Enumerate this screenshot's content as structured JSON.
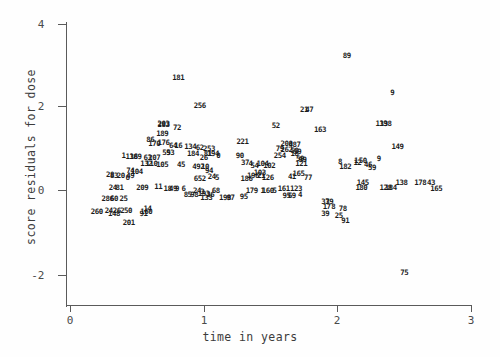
{
  "chart_data": {
    "type": "scatter",
    "title": "",
    "xlabel": "time in years",
    "ylabel": "score residuals for dose",
    "xlim": [
      -0.16,
      3.05
    ],
    "ylim": [
      -2.6,
      4.3
    ],
    "xticks": [
      0,
      1,
      2,
      3
    ],
    "xtick_labels": [
      "0",
      "1",
      "2",
      "3"
    ],
    "yticks": [
      4,
      2,
      0,
      -2
    ],
    "ytick_labels": [
      "4",
      "2",
      "0",
      "-2"
    ],
    "grid": false,
    "legend": null,
    "marker_style": "numeric-subject-id-label",
    "note": "Each plotted point is drawn as its subject id number rather than a symbol; heavy overplotting near y=0.",
    "points": [
      {
        "label": "181",
        "x": 0.81,
        "y": 2.7
      },
      {
        "label": "89",
        "x": 2.07,
        "y": 3.22
      },
      {
        "label": "9",
        "x": 2.41,
        "y": 2.34
      },
      {
        "label": "256",
        "x": 0.97,
        "y": 2.02
      },
      {
        "label": "21",
        "x": 1.75,
        "y": 1.93
      },
      {
        "label": "47",
        "x": 1.79,
        "y": 1.93
      },
      {
        "label": "139",
        "x": 2.33,
        "y": 1.6
      },
      {
        "label": "138",
        "x": 2.36,
        "y": 1.6
      },
      {
        "label": "283",
        "x": 0.7,
        "y": 1.56
      },
      {
        "label": "203",
        "x": 0.7,
        "y": 1.58
      },
      {
        "label": "72",
        "x": 0.8,
        "y": 1.5
      },
      {
        "label": "52",
        "x": 1.54,
        "y": 1.55
      },
      {
        "label": "163",
        "x": 1.87,
        "y": 1.45
      },
      {
        "label": "189",
        "x": 0.69,
        "y": 1.36
      },
      {
        "label": "86",
        "x": 0.6,
        "y": 1.2
      },
      {
        "label": "170",
        "x": 0.63,
        "y": 1.12
      },
      {
        "label": "176",
        "x": 0.7,
        "y": 1.13
      },
      {
        "label": "221",
        "x": 1.29,
        "y": 1.15
      },
      {
        "label": "200",
        "x": 1.62,
        "y": 1.12
      },
      {
        "label": "487",
        "x": 1.68,
        "y": 1.08
      },
      {
        "label": "149",
        "x": 2.45,
        "y": 1.03
      },
      {
        "label": "64",
        "x": 0.77,
        "y": 1.06
      },
      {
        "label": "16",
        "x": 0.81,
        "y": 1.05
      },
      {
        "label": "134",
        "x": 0.9,
        "y": 1.03
      },
      {
        "label": "62",
        "x": 0.97,
        "y": 1.02
      },
      {
        "label": "253",
        "x": 1.04,
        "y": 0.99
      },
      {
        "label": "79",
        "x": 1.57,
        "y": 1.0
      },
      {
        "label": "262",
        "x": 1.62,
        "y": 0.97
      },
      {
        "label": "58",
        "x": 1.68,
        "y": 0.93
      },
      {
        "label": "59",
        "x": 1.7,
        "y": 0.92
      },
      {
        "label": "55",
        "x": 0.72,
        "y": 0.9
      },
      {
        "label": "93",
        "x": 0.75,
        "y": 0.9
      },
      {
        "label": "184",
        "x": 0.92,
        "y": 0.86
      },
      {
        "label": "81",
        "x": 1.03,
        "y": 0.86
      },
      {
        "label": "194",
        "x": 1.07,
        "y": 0.86
      },
      {
        "label": "0",
        "x": 1.11,
        "y": 0.83
      },
      {
        "label": "90",
        "x": 1.27,
        "y": 0.83
      },
      {
        "label": "254",
        "x": 1.57,
        "y": 0.82
      },
      {
        "label": "18",
        "x": 1.68,
        "y": 0.86
      },
      {
        "label": "1",
        "x": 0.4,
        "y": 0.81
      },
      {
        "label": "136",
        "x": 0.46,
        "y": 0.8
      },
      {
        "label": "189",
        "x": 0.49,
        "y": 0.8
      },
      {
        "label": "63",
        "x": 0.58,
        "y": 0.77
      },
      {
        "label": "207",
        "x": 0.63,
        "y": 0.76
      },
      {
        "label": "59",
        "x": 1.72,
        "y": 0.74
      },
      {
        "label": "99",
        "x": 1.74,
        "y": 0.72
      },
      {
        "label": "9",
        "x": 2.31,
        "y": 0.74
      },
      {
        "label": "37",
        "x": 1.31,
        "y": 0.66
      },
      {
        "label": "4",
        "x": 1.35,
        "y": 0.63
      },
      {
        "label": "104",
        "x": 1.44,
        "y": 0.63
      },
      {
        "label": "54",
        "x": 1.38,
        "y": 0.57
      },
      {
        "label": "102",
        "x": 1.49,
        "y": 0.58
      },
      {
        "label": "132",
        "x": 0.57,
        "y": 0.62
      },
      {
        "label": "110",
        "x": 0.61,
        "y": 0.62
      },
      {
        "label": "105",
        "x": 0.69,
        "y": 0.6
      },
      {
        "label": "45",
        "x": 0.83,
        "y": 0.6
      },
      {
        "label": "26",
        "x": 1.0,
        "y": 0.78
      },
      {
        "label": "8",
        "x": 2.02,
        "y": 0.67
      },
      {
        "label": "1",
        "x": 2.14,
        "y": 0.7
      },
      {
        "label": "50",
        "x": 2.19,
        "y": 0.7
      },
      {
        "label": "12",
        "x": 2.15,
        "y": 0.64
      },
      {
        "label": "182",
        "x": 2.06,
        "y": 0.56
      },
      {
        "label": "59",
        "x": 2.26,
        "y": 0.53
      },
      {
        "label": "46",
        "x": 2.23,
        "y": 0.6
      },
      {
        "label": "121",
        "x": 1.73,
        "y": 0.62
      },
      {
        "label": "492",
        "x": 0.96,
        "y": 0.55
      },
      {
        "label": "10",
        "x": 1.01,
        "y": 0.55
      },
      {
        "label": "94",
        "x": 1.04,
        "y": 0.47
      },
      {
        "label": "74",
        "x": 0.45,
        "y": 0.45
      },
      {
        "label": "104",
        "x": 0.5,
        "y": 0.43
      },
      {
        "label": "49",
        "x": 0.45,
        "y": 0.33
      },
      {
        "label": "28",
        "x": 0.3,
        "y": 0.36
      },
      {
        "label": "83",
        "x": 0.33,
        "y": 0.34
      },
      {
        "label": "20",
        "x": 0.38,
        "y": 0.33
      },
      {
        "label": "6",
        "x": 0.43,
        "y": 0.3
      },
      {
        "label": "652",
        "x": 0.97,
        "y": 0.27
      },
      {
        "label": "24",
        "x": 1.06,
        "y": 0.31
      },
      {
        "label": "5",
        "x": 1.1,
        "y": 0.28
      },
      {
        "label": "21",
        "x": 1.43,
        "y": 0.33
      },
      {
        "label": "126",
        "x": 1.48,
        "y": 0.3
      },
      {
        "label": "41",
        "x": 1.66,
        "y": 0.31
      },
      {
        "label": "77",
        "x": 1.78,
        "y": 0.3
      },
      {
        "label": "165",
        "x": 1.71,
        "y": 0.38
      },
      {
        "label": "103",
        "x": 1.42,
        "y": 0.42
      },
      {
        "label": "196",
        "x": 1.37,
        "y": 0.34
      },
      {
        "label": "186",
        "x": 1.32,
        "y": 0.26
      },
      {
        "label": "145",
        "x": 2.19,
        "y": 0.17
      },
      {
        "label": "138",
        "x": 2.48,
        "y": 0.17
      },
      {
        "label": "178",
        "x": 2.62,
        "y": 0.17
      },
      {
        "label": "43",
        "x": 2.7,
        "y": 0.17
      },
      {
        "label": "180",
        "x": 2.18,
        "y": 0.05
      },
      {
        "label": "128",
        "x": 2.36,
        "y": 0.05
      },
      {
        "label": "184",
        "x": 2.4,
        "y": 0.05
      },
      {
        "label": "165",
        "x": 2.74,
        "y": 0.03
      },
      {
        "label": "24",
        "x": 0.32,
        "y": 0.06
      },
      {
        "label": "81",
        "x": 0.37,
        "y": 0.06
      },
      {
        "label": "209",
        "x": 0.54,
        "y": 0.05
      },
      {
        "label": "11",
        "x": 0.66,
        "y": 0.07
      },
      {
        "label": "18",
        "x": 0.73,
        "y": 0.03
      },
      {
        "label": "49",
        "x": 0.77,
        "y": 0.03
      },
      {
        "label": "9",
        "x": 0.8,
        "y": 0.02
      },
      {
        "label": "6",
        "x": 0.85,
        "y": 0.02
      },
      {
        "label": "24",
        "x": 0.95,
        "y": -0.03
      },
      {
        "label": "3",
        "x": 0.99,
        "y": -0.04
      },
      {
        "label": "68",
        "x": 1.09,
        "y": -0.03
      },
      {
        "label": "161",
        "x": 1.6,
        "y": 0.02
      },
      {
        "label": "123",
        "x": 1.69,
        "y": 0.02
      },
      {
        "label": "179",
        "x": 1.36,
        "y": -0.02
      },
      {
        "label": "1",
        "x": 1.44,
        "y": -0.02
      },
      {
        "label": "160",
        "x": 1.48,
        "y": -0.02
      },
      {
        "label": "5",
        "x": 1.53,
        "y": -0.02
      },
      {
        "label": "85",
        "x": 0.88,
        "y": -0.12
      },
      {
        "label": "98",
        "x": 0.93,
        "y": -0.11
      },
      {
        "label": "193",
        "x": 1.0,
        "y": -0.1
      },
      {
        "label": "36",
        "x": 1.05,
        "y": -0.11
      },
      {
        "label": "133",
        "x": 1.02,
        "y": -0.19
      },
      {
        "label": "198",
        "x": 1.16,
        "y": -0.19
      },
      {
        "label": "97",
        "x": 1.2,
        "y": -0.19
      },
      {
        "label": "95",
        "x": 1.3,
        "y": -0.18
      },
      {
        "label": "95",
        "x": 1.62,
        "y": -0.14
      },
      {
        "label": "69",
        "x": 1.66,
        "y": -0.14
      },
      {
        "label": "4",
        "x": 1.72,
        "y": -0.11
      },
      {
        "label": "286",
        "x": 0.28,
        "y": -0.21
      },
      {
        "label": "60",
        "x": 0.33,
        "y": -0.21
      },
      {
        "label": "25",
        "x": 0.4,
        "y": -0.22
      },
      {
        "label": "37",
        "x": 1.91,
        "y": -0.3
      },
      {
        "label": "39",
        "x": 1.94,
        "y": -0.3
      },
      {
        "label": "17",
        "x": 1.92,
        "y": -0.4
      },
      {
        "label": "8",
        "x": 1.97,
        "y": -0.4
      },
      {
        "label": "78",
        "x": 2.04,
        "y": -0.46
      },
      {
        "label": "39",
        "x": 1.91,
        "y": -0.58
      },
      {
        "label": "25",
        "x": 2.01,
        "y": -0.63
      },
      {
        "label": "91",
        "x": 2.06,
        "y": -0.74
      },
      {
        "label": "260",
        "x": 0.2,
        "y": -0.52
      },
      {
        "label": "24",
        "x": 0.29,
        "y": -0.5
      },
      {
        "label": "26",
        "x": 0.35,
        "y": -0.51
      },
      {
        "label": "250",
        "x": 0.42,
        "y": -0.5
      },
      {
        "label": "148",
        "x": 0.33,
        "y": -0.58
      },
      {
        "label": "14",
        "x": 0.58,
        "y": -0.46
      },
      {
        "label": "160",
        "x": 0.57,
        "y": -0.52
      },
      {
        "label": "91",
        "x": 0.55,
        "y": -0.57
      },
      {
        "label": "201",
        "x": 0.44,
        "y": -0.79
      },
      {
        "label": "75",
        "x": 2.5,
        "y": -2.0
      }
    ]
  }
}
